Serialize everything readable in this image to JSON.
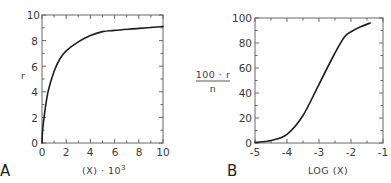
{
  "chart_data": [
    {
      "panel": "A",
      "type": "line",
      "title": "",
      "xlabel": "(X) · 10³",
      "ylabel": "r",
      "xlim": [
        0,
        10
      ],
      "ylim": [
        0,
        10
      ],
      "xticks": [
        0,
        2,
        4,
        6,
        8,
        10
      ],
      "yticks": [
        0,
        2,
        4,
        6,
        8,
        10
      ],
      "xtick_labels": [
        "0",
        "2",
        "4",
        "6",
        "8",
        "10"
      ],
      "ytick_labels": [
        "0",
        "2",
        "4",
        "6",
        "8",
        "10"
      ],
      "grid": false,
      "legend": null,
      "series": [
        {
          "name": "r vs (X)·10³",
          "x": [
            0,
            0.05,
            0.2,
            0.5,
            1,
            1.5,
            2,
            3,
            4,
            5,
            6,
            8,
            10
          ],
          "y": [
            0,
            1.0,
            2.2,
            4.0,
            5.6,
            6.6,
            7.2,
            7.9,
            8.4,
            8.7,
            8.8,
            8.95,
            9.1
          ]
        }
      ]
    },
    {
      "panel": "B",
      "type": "line",
      "title": "",
      "xlabel": "LOG (X)",
      "ylabel": "100 · r / n",
      "ylabel_numerator": "100 · r",
      "ylabel_denominator": "n",
      "xlim": [
        -5,
        -1
      ],
      "ylim": [
        0,
        100
      ],
      "xticks": [
        -5,
        -4,
        -3,
        -2,
        -1
      ],
      "yticks": [
        0,
        20,
        40,
        60,
        80,
        100
      ],
      "xtick_labels": [
        "-5",
        "-4",
        "-3",
        "-2",
        "-1"
      ],
      "ytick_labels": [
        "0",
        "20",
        "40",
        "60",
        "80",
        "100"
      ],
      "grid": false,
      "legend": null,
      "series": [
        {
          "name": "100·r/n vs LOG (X)",
          "x": [
            -5,
            -4.5,
            -4,
            -3.5,
            -3,
            -2.5,
            -2.2,
            -2,
            -1.7,
            -1.4
          ],
          "y": [
            0.5,
            2,
            7,
            22,
            47,
            72,
            85,
            89,
            93,
            96
          ]
        }
      ]
    }
  ],
  "panels": {
    "a": {
      "letter": "A",
      "xlabel_main": "(X) · 10",
      "xlabel_sup": "3",
      "ylabel": "r",
      "xtick_labels": [
        "0",
        "2",
        "4",
        "6",
        "8",
        "10"
      ],
      "ytick_labels": [
        "0",
        "2",
        "4",
        "6",
        "8",
        "10"
      ]
    },
    "b": {
      "letter": "B",
      "xlabel": "LOG (X)",
      "ylabel_numerator": "100 · r",
      "ylabel_denominator": "n",
      "xtick_labels": [
        "-5",
        "-4",
        "-3",
        "-2",
        "-1"
      ],
      "ytick_labels": [
        "0",
        "20",
        "40",
        "60",
        "80",
        "100"
      ]
    }
  }
}
